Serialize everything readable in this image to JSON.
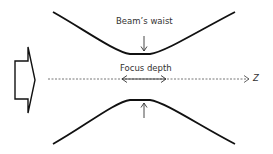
{
  "diagram": {
    "labels": {
      "waist": "Beam’s waist",
      "focus_depth": "Focus depth",
      "axis": "Z"
    },
    "colors": {
      "stroke": "#111111",
      "axis": "#777777",
      "text": "#333333"
    }
  }
}
